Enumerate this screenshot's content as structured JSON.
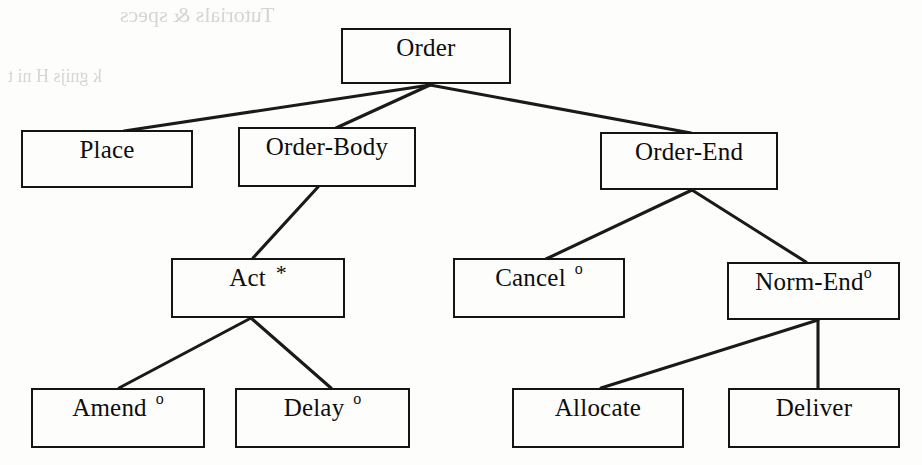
{
  "diagram": {
    "type": "tree",
    "title": "Order",
    "notation": {
      "star_symbol": "*",
      "star_meaning": "repetition / iteration",
      "optional_symbol": "o",
      "optional_meaning": "optional"
    },
    "nodes": [
      {
        "id": "order",
        "label": "Order",
        "mark": "",
        "mark_style": "none",
        "x": 341,
        "y": 28,
        "w": 170,
        "h": 56
      },
      {
        "id": "place",
        "label": "Place",
        "mark": "",
        "mark_style": "none",
        "x": 21,
        "y": 130,
        "w": 172,
        "h": 58
      },
      {
        "id": "order-body",
        "label": "Order-Body",
        "mark": "",
        "mark_style": "none",
        "x": 238,
        "y": 127,
        "w": 178,
        "h": 60
      },
      {
        "id": "order-end",
        "label": "Order-End",
        "mark": "",
        "mark_style": "none",
        "x": 600,
        "y": 132,
        "w": 178,
        "h": 58
      },
      {
        "id": "act",
        "label": "Act",
        "mark": "*",
        "mark_style": "star",
        "x": 171,
        "y": 258,
        "w": 174,
        "h": 60
      },
      {
        "id": "cancel",
        "label": "Cancel",
        "mark": "o",
        "mark_style": "opt",
        "x": 453,
        "y": 258,
        "w": 172,
        "h": 60
      },
      {
        "id": "norm-end",
        "label": "Norm-End",
        "mark": "o",
        "mark_style": "opt-tight",
        "x": 727,
        "y": 262,
        "w": 173,
        "h": 58
      },
      {
        "id": "amend",
        "label": "Amend",
        "mark": "o",
        "mark_style": "opt",
        "x": 31,
        "y": 388,
        "w": 174,
        "h": 60
      },
      {
        "id": "delay",
        "label": "Delay",
        "mark": "o",
        "mark_style": "opt",
        "x": 235,
        "y": 388,
        "w": 175,
        "h": 60
      },
      {
        "id": "allocate",
        "label": "Allocate",
        "mark": "",
        "mark_style": "none",
        "x": 512,
        "y": 388,
        "w": 172,
        "h": 60
      },
      {
        "id": "deliver",
        "label": "Deliver",
        "mark": "",
        "mark_style": "none",
        "x": 728,
        "y": 388,
        "w": 172,
        "h": 60
      }
    ],
    "edges": [
      {
        "from": "order",
        "to": "place",
        "x1": 430,
        "y1": 85,
        "x2": 124,
        "y2": 131
      },
      {
        "from": "order",
        "to": "order-body",
        "x1": 430,
        "y1": 85,
        "x2": 336,
        "y2": 128
      },
      {
        "from": "order",
        "to": "order-end",
        "x1": 430,
        "y1": 85,
        "x2": 691,
        "y2": 133
      },
      {
        "from": "order-body",
        "to": "act",
        "x1": 318,
        "y1": 187,
        "x2": 253,
        "y2": 258
      },
      {
        "from": "order-end",
        "to": "cancel",
        "x1": 692,
        "y1": 190,
        "x2": 546,
        "y2": 259
      },
      {
        "from": "order-end",
        "to": "norm-end",
        "x1": 692,
        "y1": 190,
        "x2": 806,
        "y2": 262
      },
      {
        "from": "act",
        "to": "amend",
        "x1": 251,
        "y1": 318,
        "x2": 119,
        "y2": 388
      },
      {
        "from": "act",
        "to": "delay",
        "x1": 251,
        "y1": 318,
        "x2": 331,
        "y2": 388
      },
      {
        "from": "norm-end",
        "to": "allocate",
        "x1": 818,
        "y1": 320,
        "x2": 601,
        "y2": 388
      },
      {
        "from": "norm-end",
        "to": "deliver",
        "x1": 818,
        "y1": 320,
        "x2": 818,
        "y2": 388
      }
    ]
  },
  "scan_artifacts": {
    "note": "faint mirrored show-through text from the reverse side of the scanned page",
    "lines": [
      {
        "text": "Tutorials & specs",
        "x": 120,
        "y": 2,
        "size": 22
      },
      {
        "text": "k  gnijs  H  ni  t",
        "x": 8,
        "y": 66,
        "size": 18
      }
    ]
  }
}
